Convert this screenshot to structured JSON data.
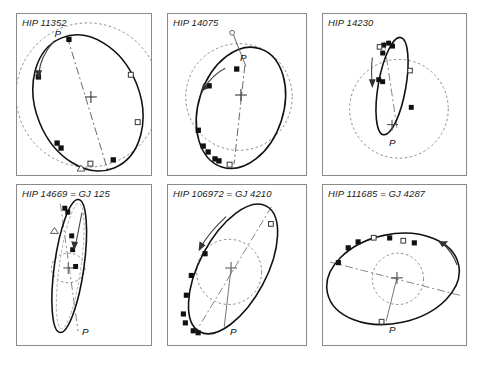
{
  "figure": {
    "caption_fragment": "",
    "marker_legend": {
      "filled_square": "micrometric observation",
      "open_square": "speckle / interferometric observation",
      "open_triangle": "photographic observation"
    },
    "symbols": {
      "periastron_label": "P",
      "center_marker": "cross",
      "direction_marker": "arrow"
    }
  },
  "panels": [
    {
      "id": "hip-11352",
      "title": "HIP 11352",
      "periastron_label": "P",
      "orbit": {
        "cx": 72,
        "cy": 90,
        "rx": 53,
        "ry": 71,
        "rotation": -22,
        "stroke": "#111111"
      },
      "reference_circle": {
        "cx": 72,
        "cy": 82,
        "r": 73,
        "stroke": "#8a8a8a"
      },
      "apsidal_line": {
        "x1": 51,
        "y1": 23,
        "x2": 92,
        "y2": 158
      },
      "center": {
        "x": 75,
        "y": 84
      },
      "markers": [
        {
          "type": "filled-square",
          "x": 53,
          "y": 26
        },
        {
          "type": "filled-square",
          "x": 22,
          "y": 64
        },
        {
          "type": "open-square",
          "x": 116,
          "y": 62
        },
        {
          "type": "open-square",
          "x": 123,
          "y": 110
        },
        {
          "type": "filled-square",
          "x": 41,
          "y": 131
        },
        {
          "type": "filled-square",
          "x": 45,
          "y": 136
        },
        {
          "type": "open-square",
          "x": 75,
          "y": 152
        },
        {
          "type": "open-triangle",
          "x": 65,
          "y": 158
        },
        {
          "type": "filled-square",
          "x": 98,
          "y": 148
        }
      ],
      "direction_arrow": {
        "x1": 36,
        "y1": 28,
        "x2": 21,
        "y2": 63
      }
    },
    {
      "id": "hip-14075",
      "title": "HIP 14075",
      "periastron_label": "P",
      "orbit": {
        "cx": 74,
        "cy": 95,
        "rx": 43,
        "ry": 63,
        "rotation": 18,
        "stroke": "#111111"
      },
      "reference_circle": {
        "cx": 72,
        "cy": 84,
        "r": 54,
        "stroke": "#8a8a8a"
      },
      "apsidal_line": {
        "x1": 78,
        "y1": 52,
        "x2": 67,
        "y2": 152
      },
      "center": {
        "x": 74,
        "y": 82
      },
      "periastron_ray": {
        "x1": 79,
        "y1": 53,
        "x2": 66,
        "y2": 20
      },
      "open_circle_end": {
        "x": 65,
        "y": 19
      },
      "markers": [
        {
          "type": "filled-square",
          "x": 70,
          "y": 56
        },
        {
          "type": "filled-square",
          "x": 42,
          "y": 73
        },
        {
          "type": "filled-square",
          "x": 31,
          "y": 118
        },
        {
          "type": "filled-square",
          "x": 36,
          "y": 134
        },
        {
          "type": "filled-square",
          "x": 41,
          "y": 140
        },
        {
          "type": "filled-square",
          "x": 48,
          "y": 147
        },
        {
          "type": "filled-square",
          "x": 52,
          "y": 149
        },
        {
          "type": "open-square",
          "x": 63,
          "y": 153
        }
      ],
      "direction_arrow": {
        "x1": 56,
        "y1": 56,
        "x2": 36,
        "y2": 76
      }
    },
    {
      "id": "hip-14230",
      "title": "HIP 14230",
      "periastron_label": "P",
      "orbit": {
        "cx": 70,
        "cy": 73,
        "rx": 14,
        "ry": 50,
        "rotation": 10,
        "stroke": "#111111"
      },
      "reference_circle": {
        "cx": 77,
        "cy": 96,
        "r": 50,
        "stroke": "#8a8a8a"
      },
      "apsidal_line": {
        "x1": 62,
        "y1": 28,
        "x2": 75,
        "y2": 115
      },
      "center": {
        "x": 70,
        "y": 112
      },
      "markers": [
        {
          "type": "filled-square",
          "x": 62,
          "y": 32
        },
        {
          "type": "filled-square",
          "x": 67,
          "y": 30
        },
        {
          "type": "open-square",
          "x": 58,
          "y": 34
        },
        {
          "type": "filled-square",
          "x": 71,
          "y": 33
        },
        {
          "type": "filled-square",
          "x": 61,
          "y": 40
        },
        {
          "type": "open-square",
          "x": 88,
          "y": 58
        },
        {
          "type": "filled-square",
          "x": 57,
          "y": 67
        },
        {
          "type": "filled-square",
          "x": 61,
          "y": 69
        },
        {
          "type": "filled-square",
          "x": 90,
          "y": 95
        }
      ],
      "direction_arrow": {
        "x1": 50,
        "y1": 44,
        "x2": 51,
        "y2": 71
      }
    },
    {
      "id": "hip-14669",
      "title": "HIP 14669 = GJ 125",
      "periastron_label": "P",
      "orbit": {
        "cx": 53,
        "cy": 82,
        "rx": 15,
        "ry": 68,
        "rotation": 8,
        "stroke": "#111111"
      },
      "reference_circle": {
        "cx": 52,
        "cy": 84,
        "r": 16,
        "stroke": "#8a8a8a"
      },
      "apsidal_line": {
        "x1": 44,
        "y1": 19,
        "x2": 62,
        "y2": 148
      },
      "center": {
        "x": 52,
        "y": 84
      },
      "markers": [
        {
          "type": "filled-square",
          "x": 49,
          "y": 24
        },
        {
          "type": "filled-square",
          "x": 52,
          "y": 28
        },
        {
          "type": "open-triangle",
          "x": 38,
          "y": 46
        },
        {
          "type": "filled-square",
          "x": 56,
          "y": 52
        },
        {
          "type": "filled-square",
          "x": 57,
          "y": 66
        },
        {
          "type": "filled-square",
          "x": 60,
          "y": 83
        }
      ],
      "direction_arrow": {
        "x1": 65,
        "y1": 30,
        "x2": 59,
        "y2": 62
      }
    },
    {
      "id": "hip-106972",
      "title": "HIP 106972 = GJ 4210",
      "periastron_label": "P",
      "orbit": {
        "cx": 66,
        "cy": 85,
        "rx": 34,
        "ry": 72,
        "rotation": 28,
        "stroke": "#111111"
      },
      "reference_circle": {
        "cx": 62,
        "cy": 88,
        "r": 33,
        "stroke": "#8a8a8a"
      },
      "apsidal_line": {
        "x1": 105,
        "y1": 22,
        "x2": 28,
        "y2": 149
      },
      "center": {
        "x": 64,
        "y": 84
      },
      "periastron_ray": {
        "x1": 64,
        "y1": 84,
        "x2": 57,
        "y2": 144
      },
      "markers": [
        {
          "type": "open-square",
          "x": 104,
          "y": 40
        },
        {
          "type": "filled-square",
          "x": 38,
          "y": 70
        },
        {
          "type": "filled-square",
          "x": 24,
          "y": 92
        },
        {
          "type": "filled-square",
          "x": 19,
          "y": 112
        },
        {
          "type": "filled-square",
          "x": 16,
          "y": 131
        },
        {
          "type": "filled-square",
          "x": 18,
          "y": 140
        },
        {
          "type": "filled-square",
          "x": 26,
          "y": 148
        },
        {
          "type": "filled-square",
          "x": 31,
          "y": 150
        }
      ],
      "direction_arrow": {
        "x1": 57,
        "y1": 33,
        "x2": 33,
        "y2": 63
      }
    },
    {
      "id": "hip-111685",
      "title": "HIP 111685 = GJ 4287",
      "periastron_label": "P",
      "orbit": {
        "cx": 71,
        "cy": 95,
        "rx": 68,
        "ry": 45,
        "rotation": -12,
        "stroke": "#111111"
      },
      "reference_circle": {
        "cx": 76,
        "cy": 95,
        "r": 26,
        "stroke": "#8a8a8a"
      },
      "apsidal_line": {
        "x1": 7,
        "y1": 78,
        "x2": 140,
        "y2": 112
      },
      "center": {
        "x": 75,
        "y": 94
      },
      "periastron_ray": {
        "x1": 75,
        "y1": 94,
        "x2": 64,
        "y2": 138
      },
      "markers": [
        {
          "type": "filled-square",
          "x": 16,
          "y": 79
        },
        {
          "type": "filled-square",
          "x": 26,
          "y": 64
        },
        {
          "type": "filled-square",
          "x": 36,
          "y": 58
        },
        {
          "type": "open-square",
          "x": 52,
          "y": 54
        },
        {
          "type": "filled-square",
          "x": 68,
          "y": 54
        },
        {
          "type": "open-square",
          "x": 82,
          "y": 57
        },
        {
          "type": "filled-square",
          "x": 93,
          "y": 59
        },
        {
          "type": "open-square",
          "x": 60,
          "y": 139
        }
      ],
      "direction_arrow": {
        "x1": 118,
        "y1": 60,
        "x2": 134,
        "y2": 80
      }
    }
  ]
}
